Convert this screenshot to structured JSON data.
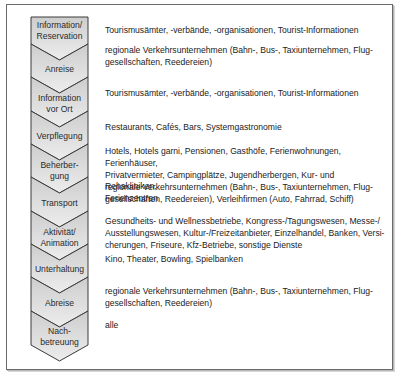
{
  "diagram": {
    "type": "process-chevron-list",
    "steps": [
      {
        "label": "Information/\nReservation",
        "lines": [
          "Information/",
          "Reservation"
        ],
        "description": "Tourismusämter, -verbände, -organisationen, Tourist-Informationen"
      },
      {
        "label": "Anreise",
        "lines": [
          "Anreise"
        ],
        "description": "regionale Verkehrsunternehmen (Bahn-, Bus-, Taxiunternehmen, Flug-gesellschaften, Reedereien)",
        "desc_lines": [
          "regionale Verkehrsunternehmen (Bahn-, Bus-, Taxiunternehmen, Flug-",
          "gesellschaften, Reedereien)"
        ]
      },
      {
        "label": "Information vor Ort",
        "lines": [
          "Information",
          "vor Ort"
        ],
        "description": "Tourismusämter, -verbände, -organisationen, Tourist-Informationen"
      },
      {
        "label": "Verpflegung",
        "lines": [
          "Verpflegung"
        ],
        "description": "Restaurants, Cafés, Bars, Systemgastronomie"
      },
      {
        "label": "Beherbergung",
        "lines": [
          "Beherber-",
          "gung"
        ],
        "description": "Hotels, Hotels garni, Pensionen, Gasthöfe, Ferienwohnungen, Ferienhäuser, Privatvermieter, Campingplätze, Jugendherbergen, Kur- und Rehakliniken, Ferienzentren",
        "desc_lines": [
          "Hotels, Hotels garni, Pensionen, Gasthöfe, Ferienwohnungen, Ferienhäuser,",
          "Privatvermieter, Campingplätze, Jugendherbergen, Kur- und Rehakliniken,",
          "Ferienzentren"
        ]
      },
      {
        "label": "Transport",
        "lines": [
          "Transport"
        ],
        "description": "regionale Verkehrsunternehmen (Bahn-, Bus-, Taxiunternehmen, Flug-gesellschaften, Reedereien), Verleihfirmen (Auto, Fahrrad, Schiff)",
        "desc_lines": [
          "regionale Verkehrsunternehmen (Bahn-, Bus-, Taxiunternehmen, Flug-",
          "gesellschaften, Reedereien), Verleihfirmen (Auto, Fahrrad, Schiff)"
        ]
      },
      {
        "label": "Aktivität/Animation",
        "lines": [
          "Aktivität/",
          "Animation"
        ],
        "description": "Gesundheits- und Wellnessbetriebe, Kongress-/Tagungswesen, Messe-/Ausstellungswesen, Kultur-/Freizeitanbieter, Einzelhandel, Banken, Versicherungen, Friseure, Kfz-Betriebe, sonstige Dienste",
        "desc_lines": [
          "Gesundheits- und Wellnessbetriebe, Kongress-/Tagungswesen, Messe-/",
          "Ausstellungswesen, Kultur-/Freizeitanbieter, Einzelhandel, Banken, Versi-",
          "cherungen, Friseure, Kfz-Betriebe, sonstige Dienste"
        ]
      },
      {
        "label": "Unterhaltung",
        "lines": [
          "Unterhaltung"
        ],
        "description": "Kino, Theater, Bowling, Spielbanken"
      },
      {
        "label": "Abreise",
        "lines": [
          "Abreise"
        ],
        "description": "regionale Verkehrsunternehmen (Bahn-, Bus-, Taxiunternehmen, Flug-gesellschaften, Reedereien)",
        "desc_lines": [
          "regionale Verkehrsunternehmen (Bahn-, Bus-, Taxiunternehmen, Flug-",
          "gesellschaften, Reedereien)"
        ]
      },
      {
        "label": "Nachbetreuung",
        "lines": [
          "Nach-",
          "betreuung"
        ],
        "description": "alle"
      }
    ]
  },
  "text": {
    "s0l0": "Information/",
    "s0l1": "Reservation",
    "s1l0": "Anreise",
    "s2l0": "Information",
    "s2l1": "vor Ort",
    "s3l0": "Verpflegung",
    "s4l0": "Beherber-",
    "s4l1": "gung",
    "s5l0": "Transport",
    "s6l0": "Aktivität/",
    "s6l1": "Animation",
    "s7l0": "Unterhaltung",
    "s8l0": "Abreise",
    "s9l0": "Nach-",
    "s9l1": "betreuung",
    "d0": [
      "Tourismusämter, -verbände, -organisationen, Tourist-Informationen"
    ],
    "d1": [
      "regionale Verkehrsunternehmen (Bahn-, Bus-, Taxiunternehmen, Flug-",
      "gesellschaften, Reedereien)"
    ],
    "d2": [
      "Tourismusämter, -verbände, -organisationen, Tourist-Informationen"
    ],
    "d3": [
      "Restaurants, Cafés, Bars, Systemgastronomie"
    ],
    "d4": [
      "Hotels, Hotels garni, Pensionen, Gasthöfe, Ferienwohnungen, Ferienhäuser,",
      "Privatvermieter, Campingplätze, Jugendherbergen, Kur- und Rehakliniken,",
      "Ferienzentren"
    ],
    "d5": [
      "regionale Verkehrsunternehmen (Bahn-, Bus-, Taxiunternehmen, Flug-",
      "gesellschaften, Reedereien), Verleihfirmen (Auto, Fahrrad, Schiff)"
    ],
    "d6": [
      "Gesundheits- und Wellnessbetriebe, Kongress-/Tagungswesen, Messe-/",
      "Ausstellungswesen, Kultur-/Freizeitanbieter, Einzelhandel, Banken, Versi-",
      "cherungen, Friseure, Kfz-Betriebe, sonstige Dienste"
    ],
    "d7": [
      "Kino, Theater, Bowling, Spielbanken"
    ],
    "d8": [
      "regionale Verkehrsunternehmen (Bahn-, Bus-, Taxiunternehmen, Flug-",
      "gesellschaften, Reedereien)"
    ],
    "d9": [
      "alle"
    ]
  },
  "colors": {
    "border": "#3a3a3a",
    "fill_top": "#cfcfcf",
    "fill_bottom": "#ececec",
    "frame": "#6a6a6a",
    "text": "#222222"
  }
}
